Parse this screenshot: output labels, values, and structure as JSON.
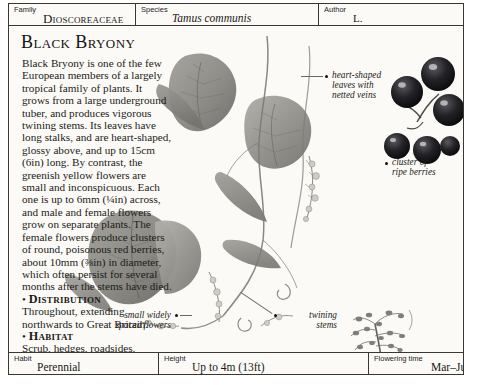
{
  "header": {
    "family_label": "Family",
    "family_value": "Dioscoreaceae",
    "species_label": "Species",
    "species_value": "Tamus communis",
    "author_label": "Author",
    "author_value": "L."
  },
  "main": {
    "title": "Black Bryony",
    "paragraph": "Black Bryony is one of the few European members of a largely tropical family of plants. It grows from a large underground tuber, and produces vigorous twining stems. Its leaves have long stalks, and are heart-shaped, glossy above, and up to 15cm (6in) long. By contrast, the greenish yellow flowers are small and inconspicuous. Each one is up to 6mm (¼in) across, and male and female flowers grow on separate plants. The female flowers produce clusters of round, poisonous red berries, about 10mm (⅜in) in diameter, which often persist for several months after the stems have died.",
    "distribution_bullet": "•",
    "distribution_heading": "Distribution",
    "distribution_text": "Throughout, extending northwards to Great Britain.",
    "habitat_bullet": "•",
    "habitat_heading": "Habitat",
    "habitat_text": "Scrub, hedges, roadsides."
  },
  "annotations": {
    "leaves": "heart-shaped\nleaves with\nnetted veins",
    "berries": "cluster of\nripe berries",
    "flowers": "small widely\nspaced flowers",
    "stems": "twining\nstems"
  },
  "footer": {
    "habit_label": "Habit",
    "habit_value": "Perennial",
    "height_label": "Height",
    "height_value": "Up to 4m (13ft)",
    "flowering_label": "Flowering time",
    "flowering_value": "Mar–July"
  },
  "colors": {
    "border": "#3a3730",
    "paper": "#fbfaf7",
    "text": "#1d1b16",
    "berry": "#17161a",
    "leaf": "#8e8d88"
  }
}
